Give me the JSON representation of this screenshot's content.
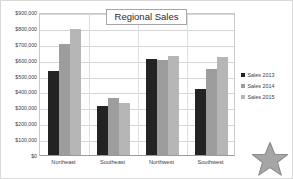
{
  "chart_data": {
    "type": "bar",
    "title": "Regional Sales",
    "xlabel": "",
    "ylabel": "",
    "categories": [
      "Northeast",
      "Southeast",
      "Northwest",
      "Southwest"
    ],
    "series": [
      {
        "name": "Sales 2013",
        "color": "#232323",
        "values": [
          528000,
          307000,
          605000,
          418000
        ]
      },
      {
        "name": "Sales 2014",
        "color": "#9d9d9d",
        "values": [
          699000,
          358000,
          597000,
          543000
        ]
      },
      {
        "name": "Sales 2015",
        "color": "#b6b6b6",
        "values": [
          795000,
          327000,
          622000,
          620000
        ]
      }
    ],
    "ylim": [
      0,
      900000
    ],
    "ytick_values": [
      0,
      100000,
      200000,
      300000,
      400000,
      500000,
      600000,
      700000,
      800000,
      900000
    ],
    "ytick_labels": [
      "$0",
      "$100,000",
      "$200,000",
      "$300,000",
      "$400,000",
      "$500,000",
      "$600,000",
      "$700,000",
      "$800,000",
      "$900,000"
    ],
    "grid": true,
    "legend_position": "right",
    "legend_entries": [
      "Sales 2013",
      "Sales 2014",
      "Sales 2015"
    ]
  },
  "decorations": {
    "star": {
      "name": "star-shape",
      "fill": "#a6a6a6",
      "stroke": "#8c8c8c"
    }
  }
}
